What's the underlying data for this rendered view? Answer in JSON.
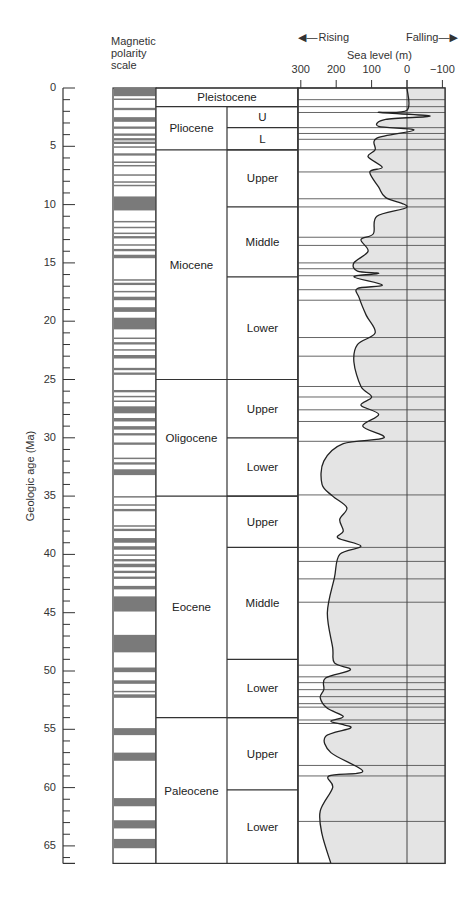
{
  "header": {
    "polarity_label": [
      "Magnetic",
      "polarity",
      "scale"
    ],
    "rising_label": "Rising",
    "falling_label": "Falling",
    "sea_level_title": "Sea level (m)",
    "y_axis_label": "Geologic age (Ma)"
  },
  "chart_data": {
    "type": "area",
    "xlabel": "Sea level (m)",
    "ylabel": "Geologic age (Ma)",
    "x_ticks": [
      300,
      200,
      100,
      0,
      -100
    ],
    "x_range": [
      300,
      -100
    ],
    "y_ticks": [
      0,
      5,
      10,
      15,
      20,
      25,
      30,
      35,
      40,
      45,
      50,
      55,
      60,
      65
    ],
    "y_range": [
      0,
      66.5
    ],
    "annotations": [
      "Rising (toward left)",
      "Falling (toward right)"
    ],
    "epochs": [
      {
        "name": "Pleistocene",
        "start": 0,
        "end": 1.6,
        "subdivisions": []
      },
      {
        "name": "Pliocene",
        "start": 1.6,
        "end": 5.3,
        "subdivisions": [
          {
            "name": "U",
            "start": 1.6,
            "end": 3.4
          },
          {
            "name": "L",
            "start": 3.4,
            "end": 5.3
          }
        ]
      },
      {
        "name": "Miocene",
        "start": 5.3,
        "end": 25.0,
        "subdivisions": [
          {
            "name": "Upper",
            "start": 5.3,
            "end": 10.2
          },
          {
            "name": "Middle",
            "start": 10.2,
            "end": 16.2
          },
          {
            "name": "Lower",
            "start": 16.2,
            "end": 25.0
          }
        ]
      },
      {
        "name": "Oligocene",
        "start": 25.0,
        "end": 35.0,
        "subdivisions": [
          {
            "name": "Upper",
            "start": 25.0,
            "end": 30.0
          },
          {
            "name": "Lower",
            "start": 30.0,
            "end": 35.0
          }
        ]
      },
      {
        "name": "Eocene",
        "start": 35.0,
        "end": 54.0,
        "subdivisions": [
          {
            "name": "Upper",
            "start": 35.0,
            "end": 39.4
          },
          {
            "name": "Middle",
            "start": 39.4,
            "end": 49.0
          },
          {
            "name": "Lower",
            "start": 49.0,
            "end": 54.0
          }
        ]
      },
      {
        "name": "Paleocene",
        "start": 54.0,
        "end": 66.5,
        "subdivisions": [
          {
            "name": "Upper",
            "start": 54.0,
            "end": 60.2
          },
          {
            "name": "Lower",
            "start": 60.2,
            "end": 66.5
          }
        ]
      }
    ],
    "normal_polarity_intervals_ma": [
      [
        0,
        0.7
      ],
      [
        0.9,
        1.0
      ],
      [
        1.7,
        1.9
      ],
      [
        2.5,
        2.9
      ],
      [
        3.3,
        3.5
      ],
      [
        3.9,
        4.1
      ],
      [
        4.3,
        4.5
      ],
      [
        4.6,
        4.8
      ],
      [
        5.0,
        5.1
      ],
      [
        5.6,
        5.8
      ],
      [
        6.3,
        6.4
      ],
      [
        6.6,
        6.7
      ],
      [
        7.4,
        7.5
      ],
      [
        8.0,
        8.1
      ],
      [
        8.3,
        8.4
      ],
      [
        9.3,
        10.5
      ],
      [
        11.4,
        11.5
      ],
      [
        11.9,
        12.0
      ],
      [
        12.4,
        12.5
      ],
      [
        12.7,
        12.9
      ],
      [
        13.4,
        13.5
      ],
      [
        13.8,
        14.0
      ],
      [
        14.3,
        14.6
      ],
      [
        16.4,
        16.5
      ],
      [
        16.7,
        16.9
      ],
      [
        17.4,
        17.5
      ],
      [
        17.9,
        18.2
      ],
      [
        18.8,
        19.2
      ],
      [
        19.7,
        20.7
      ],
      [
        21.4,
        21.5
      ],
      [
        21.8,
        22.0
      ],
      [
        22.4,
        22.5
      ],
      [
        22.9,
        23.2
      ],
      [
        24.0,
        24.2
      ],
      [
        24.4,
        24.6
      ],
      [
        25.9,
        26.1
      ],
      [
        26.4,
        26.5
      ],
      [
        26.8,
        26.9
      ],
      [
        27.3,
        27.9
      ],
      [
        28.3,
        28.6
      ],
      [
        29.0,
        29.3
      ],
      [
        29.6,
        29.8
      ],
      [
        30.4,
        30.6
      ],
      [
        31.7,
        31.8
      ],
      [
        32.1,
        32.3
      ],
      [
        32.7,
        33.2
      ],
      [
        35.0,
        35.1
      ],
      [
        35.7,
        35.8
      ],
      [
        36.1,
        36.3
      ],
      [
        37.5,
        37.6
      ],
      [
        37.8,
        38.0
      ],
      [
        38.6,
        39.0
      ],
      [
        39.3,
        39.6
      ],
      [
        40.0,
        40.1
      ],
      [
        40.4,
        40.6
      ],
      [
        40.8,
        41.1
      ],
      [
        41.4,
        41.6
      ],
      [
        41.9,
        42.1
      ],
      [
        42.7,
        43.0
      ],
      [
        43.6,
        44.9
      ],
      [
        46.9,
        48.4
      ],
      [
        49.7,
        50.1
      ],
      [
        50.8,
        51.1
      ],
      [
        51.7,
        51.8
      ],
      [
        52.0,
        52.3
      ],
      [
        54.9,
        55.5
      ],
      [
        57.0,
        57.7
      ],
      [
        60.9,
        61.6
      ],
      [
        62.8,
        63.5
      ],
      [
        64.4,
        65.2
      ]
    ],
    "sea_level_curve": [
      {
        "age": 0.0,
        "sea_level_m": 0
      },
      {
        "age": 1.9,
        "sea_level_m": 0
      },
      {
        "age": 2.1,
        "sea_level_m": 80
      },
      {
        "age": 2.4,
        "sea_level_m": -65
      },
      {
        "age": 2.7,
        "sea_level_m": 60
      },
      {
        "age": 3.3,
        "sea_level_m": 80
      },
      {
        "age": 3.6,
        "sea_level_m": -20
      },
      {
        "age": 4.3,
        "sea_level_m": 85
      },
      {
        "age": 5.3,
        "sea_level_m": 90
      },
      {
        "age": 5.9,
        "sea_level_m": 110
      },
      {
        "age": 6.8,
        "sea_level_m": 70
      },
      {
        "age": 7.2,
        "sea_level_m": 105
      },
      {
        "age": 8.5,
        "sea_level_m": 80
      },
      {
        "age": 9.4,
        "sea_level_m": 60
      },
      {
        "age": 10.2,
        "sea_level_m": 0
      },
      {
        "age": 11.0,
        "sea_level_m": 85
      },
      {
        "age": 12.5,
        "sea_level_m": 95
      },
      {
        "age": 13.0,
        "sea_level_m": 130
      },
      {
        "age": 14.0,
        "sea_level_m": 110
      },
      {
        "age": 15.0,
        "sea_level_m": 150
      },
      {
        "age": 15.7,
        "sea_level_m": 140
      },
      {
        "age": 15.9,
        "sea_level_m": 80
      },
      {
        "age": 16.2,
        "sea_level_m": 150
      },
      {
        "age": 16.9,
        "sea_level_m": 70
      },
      {
        "age": 17.2,
        "sea_level_m": 140
      },
      {
        "age": 18.0,
        "sea_level_m": 135
      },
      {
        "age": 19.5,
        "sea_level_m": 115
      },
      {
        "age": 21.0,
        "sea_level_m": 90
      },
      {
        "age": 22.0,
        "sea_level_m": 140
      },
      {
        "age": 23.5,
        "sea_level_m": 150
      },
      {
        "age": 25.6,
        "sea_level_m": 130
      },
      {
        "age": 26.5,
        "sea_level_m": 100
      },
      {
        "age": 27.2,
        "sea_level_m": 130
      },
      {
        "age": 28.0,
        "sea_level_m": 80
      },
      {
        "age": 29.0,
        "sea_level_m": 125
      },
      {
        "age": 30.0,
        "sea_level_m": 65
      },
      {
        "age": 30.5,
        "sea_level_m": 180
      },
      {
        "age": 32.0,
        "sea_level_m": 235
      },
      {
        "age": 34.0,
        "sea_level_m": 240
      },
      {
        "age": 35.0,
        "sea_level_m": 210
      },
      {
        "age": 36.0,
        "sea_level_m": 170
      },
      {
        "age": 37.0,
        "sea_level_m": 190
      },
      {
        "age": 38.0,
        "sea_level_m": 180
      },
      {
        "age": 38.6,
        "sea_level_m": 195
      },
      {
        "age": 39.3,
        "sea_level_m": 130
      },
      {
        "age": 40.0,
        "sea_level_m": 190
      },
      {
        "age": 42.0,
        "sea_level_m": 205
      },
      {
        "age": 45.0,
        "sea_level_m": 225
      },
      {
        "age": 48.0,
        "sea_level_m": 210
      },
      {
        "age": 49.3,
        "sea_level_m": 205
      },
      {
        "age": 49.9,
        "sea_level_m": 160
      },
      {
        "age": 50.6,
        "sea_level_m": 230
      },
      {
        "age": 51.6,
        "sea_level_m": 235
      },
      {
        "age": 52.3,
        "sea_level_m": 245
      },
      {
        "age": 53.2,
        "sea_level_m": 225
      },
      {
        "age": 53.9,
        "sea_level_m": 180
      },
      {
        "age": 54.3,
        "sea_level_m": 215
      },
      {
        "age": 54.6,
        "sea_level_m": 180
      },
      {
        "age": 54.9,
        "sea_level_m": 160
      },
      {
        "age": 55.6,
        "sea_level_m": 230
      },
      {
        "age": 57.0,
        "sea_level_m": 215
      },
      {
        "age": 58.6,
        "sea_level_m": 125
      },
      {
        "age": 59.0,
        "sea_level_m": 220
      },
      {
        "age": 60.0,
        "sea_level_m": 210
      },
      {
        "age": 62.0,
        "sea_level_m": 245
      },
      {
        "age": 64.0,
        "sea_level_m": 240
      },
      {
        "age": 66.5,
        "sea_level_m": 215
      }
    ],
    "grid_lines_ma": [
      1.0,
      1.6,
      2.1,
      3.4,
      3.9,
      4.4,
      5.3,
      7.2,
      9.5,
      10.2,
      12.8,
      13.5,
      15.0,
      15.5,
      16.1,
      17.3,
      18.2,
      21.4,
      23.0,
      25.6,
      26.5,
      27.6,
      28.6,
      30.3,
      34.9,
      39.4,
      40.6,
      42.1,
      44.1,
      49.5,
      50.5,
      51.0,
      51.6,
      52.2,
      52.8,
      53.1,
      54.2,
      54.5,
      58.1,
      59.0,
      62.9
    ]
  }
}
